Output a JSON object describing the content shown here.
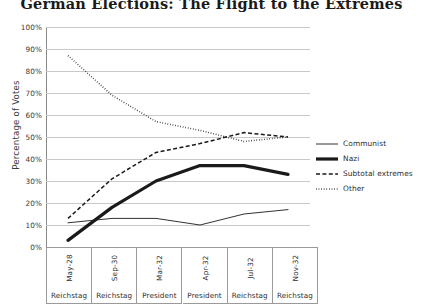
{
  "chart_data": {
    "type": "line",
    "title": "German Elections: The Flight to the Extremes",
    "xlabel": "",
    "ylabel": "Percentage of Votes",
    "ylim": [
      0,
      100
    ],
    "ytick_labels": [
      "100%",
      "90%",
      "80%",
      "70%",
      "60%",
      "50%",
      "40%",
      "30%",
      "20%",
      "10%",
      "0%"
    ],
    "ytick_values": [
      100,
      90,
      80,
      70,
      60,
      50,
      40,
      30,
      20,
      10,
      0
    ],
    "grid": true,
    "legend_position": "right",
    "categories": [
      "May-28",
      "Sep-30",
      "Mar-32",
      "Apr-32",
      "Jul-32",
      "Nov-32"
    ],
    "category_types": [
      "Reichstag",
      "Reichstag",
      "President",
      "President",
      "Reichstag",
      "Reichstag"
    ],
    "series": [
      {
        "name": "Communist",
        "style": "solid-thin",
        "values": [
          11,
          13,
          13,
          10,
          15,
          17
        ]
      },
      {
        "name": "Nazi",
        "style": "solid-thick",
        "values": [
          3,
          18,
          30,
          37,
          37,
          33
        ]
      },
      {
        "name": "Subtotal extremes",
        "style": "dashed",
        "values": [
          13,
          31,
          43,
          47,
          52,
          50
        ]
      },
      {
        "name": "Other",
        "style": "dotted",
        "values": [
          87,
          69,
          57,
          53,
          48,
          50
        ]
      }
    ]
  },
  "colors": {
    "line": "#1a1a1a",
    "grid": "#c9c9c9",
    "axis": "#8a8a8a",
    "text": "#2e2e2e"
  }
}
